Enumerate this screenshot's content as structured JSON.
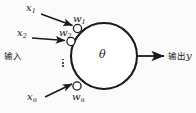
{
  "figure": {
    "type": "neuron-model-diagram",
    "title_visible": false,
    "background_color": "#fbfbfb",
    "stroke_color": "#1a1a1a",
    "node_fill": "#ffffff"
  },
  "labels": {
    "input_group": "输入",
    "output_group": "输出",
    "output_variable": "y",
    "threshold": "θ"
  },
  "inputs": [
    {
      "name": "x",
      "sub": "1",
      "weight_name": "w",
      "weight_sub": "1"
    },
    {
      "name": "x",
      "sub": "2",
      "weight_name": "w",
      "weight_sub": "2"
    },
    {
      "name": "x",
      "sub": "n",
      "weight_name": "w",
      "weight_sub": "n"
    }
  ],
  "ellipsis": {
    "orientation": "vertical",
    "dot_count": 3
  },
  "icons": {
    "arrow": "arrow-right-icon",
    "soma": "neuron-body-circle-icon",
    "synapse": "synapse-node-icon"
  }
}
